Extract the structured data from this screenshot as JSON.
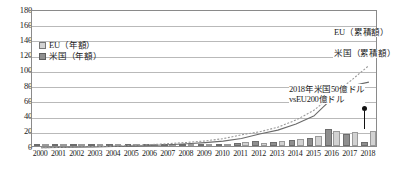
{
  "chart_data": {
    "type": "bar",
    "title": "",
    "xlabel": "",
    "ylabel": "",
    "ylim": [
      0,
      180
    ],
    "ytick_step": 20,
    "yticks": [
      0,
      20,
      40,
      60,
      80,
      100,
      120,
      140,
      160,
      180
    ],
    "grid": true,
    "legend_position": "upper-left",
    "categories": [
      "2000",
      "2001",
      "2002",
      "2003",
      "2004",
      "2005",
      "2006",
      "2007",
      "2008",
      "2009",
      "2010",
      "2011",
      "2012",
      "2013",
      "2014",
      "2015",
      "2016",
      "2017",
      "2018"
    ],
    "series": [
      {
        "name": "米国（年額）",
        "kind": "bar",
        "color": "#8f8f8f",
        "values": [
          0.3,
          0.3,
          0.4,
          0.4,
          0.5,
          0.6,
          0.8,
          1.0,
          1.2,
          1.5,
          2.0,
          3.5,
          6.0,
          5.0,
          8.0,
          11.0,
          23.0,
          16.0,
          5.0
        ]
      },
      {
        "name": "EU（年額）",
        "kind": "bar",
        "color": "#d2d2d2",
        "values": [
          0.4,
          0.4,
          0.5,
          0.6,
          0.7,
          0.8,
          1.0,
          1.3,
          1.6,
          2.0,
          3.0,
          5.0,
          4.0,
          6.0,
          9.5,
          13.0,
          20.0,
          18.5,
          20.0
        ]
      },
      {
        "name": "EU（累積額）",
        "kind": "line",
        "style": "dashed",
        "color": "#9a9a9a",
        "values": [
          0.4,
          0.8,
          1.3,
          1.9,
          2.6,
          3.4,
          4.4,
          5.7,
          7.3,
          9.3,
          12.3,
          17.3,
          21.3,
          27.3,
          36.8,
          49.8,
          69.8,
          88.3,
          108.3
        ]
      },
      {
        "name": "米国（累積額）",
        "kind": "line",
        "style": "solid",
        "color": "#6b6b6b",
        "values": [
          0.3,
          0.6,
          1.0,
          1.4,
          1.9,
          2.5,
          3.3,
          4.3,
          5.5,
          7.0,
          9.0,
          12.5,
          18.5,
          23.5,
          31.5,
          42.5,
          65.5,
          81.5,
          86.5
        ]
      }
    ],
    "legend_entries": [
      {
        "label": "EU（年額）",
        "swatch": "eu"
      },
      {
        "label": "米国（年額）",
        "swatch": "us"
      }
    ],
    "series_labels": {
      "eu_cumulative": "EU（累積額）",
      "us_cumulative": "米国（累積額）"
    },
    "annotation": {
      "line1": "2018年米国50億ドル",
      "line2": "vsEU200億ドル"
    }
  }
}
